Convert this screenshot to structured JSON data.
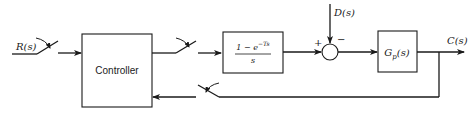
{
  "diagram": {
    "type": "sampled-data control system block diagram",
    "input": {
      "label": "R(s)"
    },
    "output": {
      "label": "C(s)"
    },
    "disturbance": {
      "label": "D(s)"
    },
    "blocks": [
      {
        "id": "controller",
        "label": "Controller"
      },
      {
        "id": "zoh",
        "numerator": "1 − e",
        "exponent": "−Ts",
        "denominator": "s"
      },
      {
        "id": "plant",
        "label_main": "G",
        "label_sub": "p",
        "label_arg": "(s)"
      }
    ],
    "summing_junction": {
      "plus_sign": "+",
      "minus_sign": "−"
    },
    "samplers": [
      {
        "id": "input-sampler",
        "location": "between R(s) and Controller"
      },
      {
        "id": "controller-output-sampler",
        "location": "between Controller and ZOH"
      },
      {
        "id": "feedback-sampler",
        "location": "feedback path from C(s) to Controller"
      }
    ],
    "colors": {
      "line": "#1a1a1a",
      "background": "#ffffff"
    }
  }
}
